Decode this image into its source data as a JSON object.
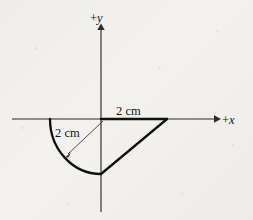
{
  "figure": {
    "kind": "geometry-diagram",
    "background_color": "#f2f1ee",
    "ink_color": "#101010",
    "axes": {
      "x_axis_label": "+x",
      "y_axis_label": "+y",
      "x_axis_name": "x-axis",
      "y_axis_name": "y-axis",
      "origin": {
        "x": 101,
        "y": 119
      },
      "x_axis_from": {
        "x": 12,
        "y": 119
      },
      "x_axis_to": {
        "x": 218,
        "y": 119
      },
      "y_axis_from": {
        "x": 101,
        "y": 26
      },
      "y_axis_to": {
        "x": 101,
        "y": 212
      }
    },
    "labels": {
      "top_dimension": "2 cm",
      "radius_dimension": "2 cm",
      "x_sign": "+",
      "x_var": "x",
      "y_sign": "+",
      "y_var": "y"
    },
    "shape": {
      "description": "quarter-circle arc plus chord",
      "radius_cm": 2,
      "arc_start_point": {
        "x": 50,
        "y": 119
      },
      "arc_end_point": {
        "x": 101,
        "y": 174
      },
      "arc_radius_px": 53,
      "segment_top_start": {
        "x": 101,
        "y": 119
      },
      "segment_top_end": {
        "x": 167,
        "y": 119
      },
      "diagonal_start": {
        "x": 167,
        "y": 119
      },
      "diagonal_end": {
        "x": 101,
        "y": 174
      }
    },
    "dimension_arrow": {
      "from": {
        "x": 103,
        "y": 121
      },
      "to": {
        "x": 64,
        "y": 158
      }
    }
  }
}
